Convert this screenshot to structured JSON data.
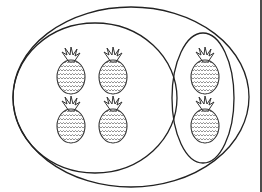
{
  "diagram": {
    "colors": {
      "stroke": "#222222",
      "background": "#ffffff",
      "pattern": "#555555"
    },
    "outer_set": {
      "label": "",
      "count": 6
    },
    "groups": [
      {
        "name": "left-group",
        "count": 4
      },
      {
        "name": "right-group",
        "count": 2
      }
    ],
    "items": [
      {
        "icon": "pineapple-icon",
        "group": "left-group",
        "x": 71,
        "y": 77
      },
      {
        "icon": "pineapple-icon",
        "group": "left-group",
        "x": 113,
        "y": 77
      },
      {
        "icon": "pineapple-icon",
        "group": "left-group",
        "x": 71,
        "y": 126
      },
      {
        "icon": "pineapple-icon",
        "group": "left-group",
        "x": 113,
        "y": 126
      },
      {
        "icon": "pineapple-icon",
        "group": "right-group",
        "x": 205,
        "y": 77
      },
      {
        "icon": "pineapple-icon",
        "group": "right-group",
        "x": 205,
        "y": 126
      }
    ]
  }
}
